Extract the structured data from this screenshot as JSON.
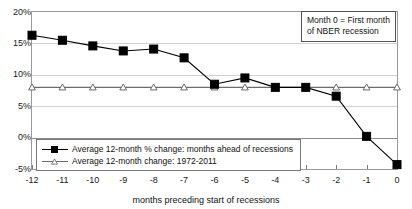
{
  "chart_data": {
    "type": "line",
    "title": "",
    "xlabel": "months preceding start of recessions",
    "ylabel": "",
    "x": [
      -12,
      -11,
      -10,
      -9,
      -8,
      -7,
      -6,
      -5,
      -4,
      -3,
      -2,
      -1,
      0
    ],
    "xtick_labels": [
      "-12",
      "-11",
      "-10",
      "-9",
      "-8",
      "-7",
      "-6",
      "-5",
      "-4",
      "-3",
      "-2",
      "-1",
      "0"
    ],
    "ytick_labels": [
      "20%",
      "15%",
      "10%",
      "5%",
      "0%",
      "-5%"
    ],
    "ytick_values": [
      20,
      15,
      10,
      5,
      0,
      -5
    ],
    "ylim": [
      -5,
      20
    ],
    "xlim": [
      -12,
      0
    ],
    "grid": true,
    "legend_position": "lower-left-inside",
    "series": [
      {
        "name": "Average 12-month % change: months ahead of recessions",
        "marker": "filled-square",
        "color": "#000000",
        "values": [
          16.3,
          15.5,
          14.6,
          13.8,
          14.1,
          12.7,
          8.5,
          9.5,
          8.0,
          8.0,
          6.6,
          0.2,
          -4.3
        ]
      },
      {
        "name": "Average 12-month change: 1972-2011",
        "marker": "open-triangle",
        "color": "#6b6b6b",
        "values": [
          8.0,
          8.0,
          8.0,
          8.0,
          8.0,
          8.0,
          8.0,
          8.0,
          8.0,
          8.0,
          8.0,
          8.0,
          8.0
        ]
      }
    ],
    "annotations": [
      {
        "id": "month-zero-note",
        "line1": "Month 0 = First month",
        "line2": "of NBER recession"
      }
    ]
  },
  "colors": {
    "series_primary": "#000000",
    "series_secondary": "#6b6b6b",
    "grid": "#d2d2d2",
    "axis": "#8c8c8c",
    "background": "#ffffff"
  }
}
